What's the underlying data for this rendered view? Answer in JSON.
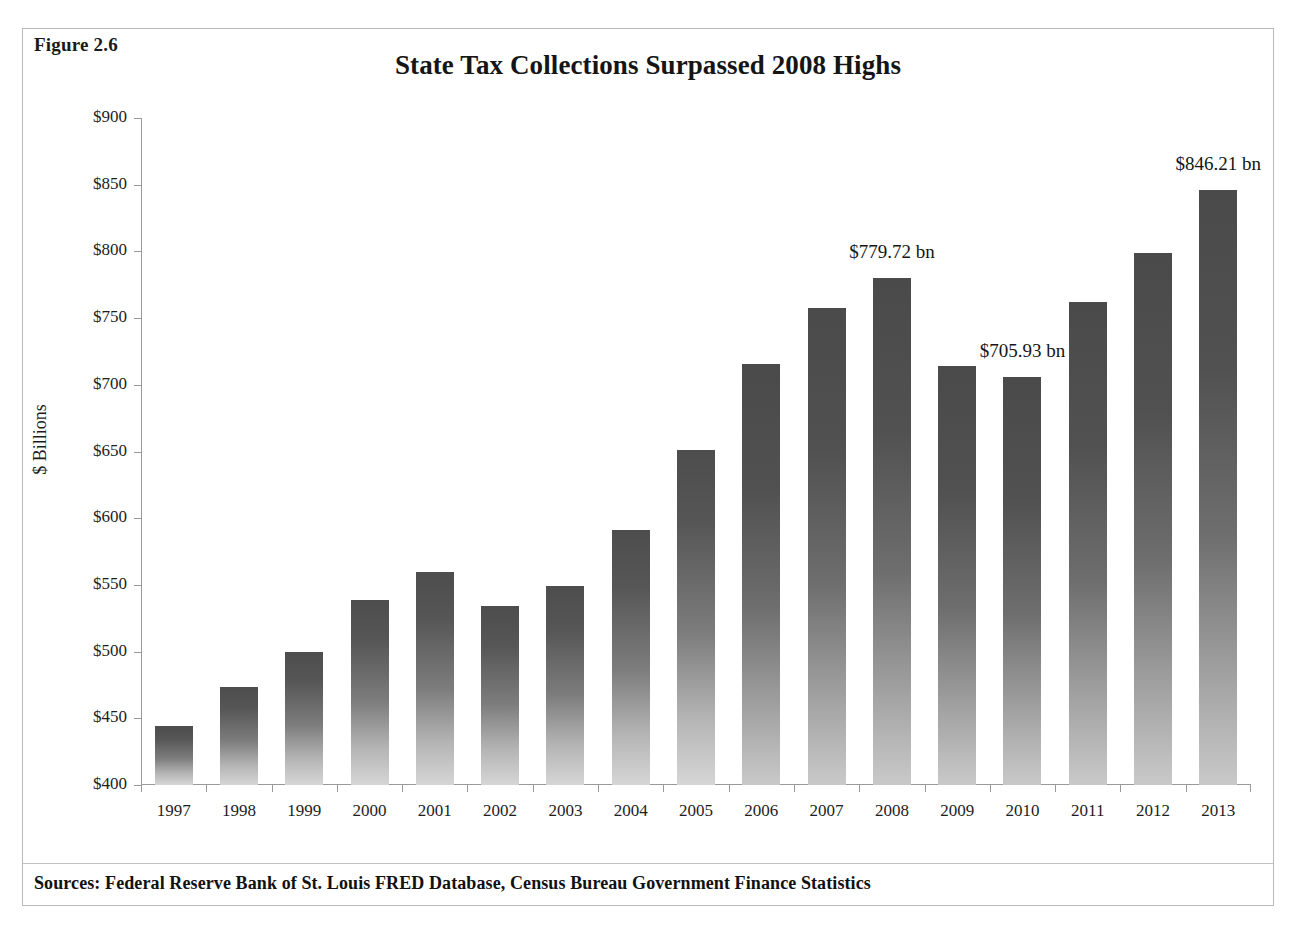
{
  "figure": {
    "number": "Figure 2.6",
    "source_note": "Sources: Federal Reserve Bank of St. Louis FRED Database, Census Bureau Government Finance Statistics"
  },
  "chart_data": {
    "type": "bar",
    "title": "State Tax Collections Surpassed 2008 Highs",
    "xlabel": "",
    "ylabel": "$ Billions",
    "ylim": [
      400,
      900
    ],
    "ytick_step": 50,
    "ytick_labels": [
      "$900",
      "$850",
      "$800",
      "$750",
      "$700",
      "$650",
      "$600",
      "$550",
      "$500",
      "$450",
      "$400"
    ],
    "ytick_values": [
      900,
      850,
      800,
      750,
      700,
      650,
      600,
      550,
      500,
      450,
      400
    ],
    "grid": false,
    "legend": "none",
    "categories": [
      "1997",
      "1998",
      "1999",
      "2000",
      "2001",
      "2002",
      "2003",
      "2004",
      "2005",
      "2006",
      "2007",
      "2008",
      "2009",
      "2010",
      "2011",
      "2012",
      "2013"
    ],
    "values": [
      444.5,
      473.5,
      500.0,
      539.0,
      559.5,
      534.5,
      549.0,
      591.0,
      651.0,
      715.5,
      757.5,
      779.72,
      714.0,
      705.93,
      762.0,
      798.5,
      846.21
    ],
    "annotations": [
      {
        "category": "2008",
        "text": "$779.72 bn",
        "value": 779.72
      },
      {
        "category": "2010",
        "text": "$705.93 bn",
        "value": 705.93
      },
      {
        "category": "2013",
        "text": "$846.21 bn",
        "value": 846.21
      }
    ],
    "bar_color_top": "#4d4d4d",
    "bar_color_bottom": "#d6d6d6"
  }
}
